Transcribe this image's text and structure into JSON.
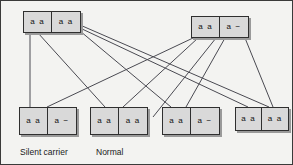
{
  "figure": {
    "background_color": "#f3f3f1",
    "box_fill_color": "#d9d9d9",
    "box_border_color": "#2f2f2f",
    "line_color": "#4a4a52"
  },
  "parents": [
    {
      "id": "parent-left",
      "left_allele": "a a",
      "right_allele": "a a",
      "x": 22,
      "y": 10,
      "w": 58,
      "h": 22
    },
    {
      "id": "parent-right",
      "left_allele": "a a",
      "right_allele": "a −",
      "x": 190,
      "y": 15,
      "w": 58,
      "h": 22
    }
  ],
  "offspring": [
    {
      "id": "offspring-1",
      "left_allele": "a a",
      "right_allele": "a −",
      "caption": "Silent carrier",
      "x": 18,
      "y": 106,
      "w": 58,
      "h": 28
    },
    {
      "id": "offspring-2",
      "left_allele": "a a",
      "right_allele": "a a",
      "caption": "Normal",
      "x": 89,
      "y": 106,
      "w": 58,
      "h": 28
    },
    {
      "id": "offspring-3",
      "left_allele": "a a",
      "right_allele": "a −",
      "caption": "",
      "x": 161,
      "y": 106,
      "w": 58,
      "h": 28
    },
    {
      "id": "offspring-4",
      "left_allele": "a a",
      "right_allele": "a a",
      "caption": "",
      "x": 234,
      "y": 106,
      "w": 54,
      "h": 24
    }
  ],
  "captions": [
    {
      "text": "Silent carrier",
      "x": 19,
      "y": 146
    },
    {
      "text": "Normal",
      "x": 95,
      "y": 146
    }
  ],
  "connections": [
    {
      "from": "parent-left",
      "x1": 29,
      "y1": 32,
      "x2": 29,
      "y2": 106
    },
    {
      "from": "parent-left",
      "x1": 37,
      "y1": 32,
      "x2": 104,
      "y2": 106
    },
    {
      "from": "parent-left",
      "x1": 79,
      "y1": 30,
      "x2": 170,
      "y2": 106
    },
    {
      "from": "parent-left",
      "x1": 79,
      "y1": 27,
      "x2": 247,
      "y2": 106
    },
    {
      "from": "parent-left",
      "x1": 79,
      "y1": 24,
      "x2": 268,
      "y2": 106
    },
    {
      "from": "parent-right",
      "x1": 192,
      "y1": 37,
      "x2": 46,
      "y2": 106
    },
    {
      "from": "parent-right",
      "x1": 197,
      "y1": 37,
      "x2": 122,
      "y2": 106
    },
    {
      "from": "parent-right",
      "x1": 215,
      "y1": 37,
      "x2": 152,
      "y2": 116
    },
    {
      "from": "parent-right",
      "x1": 224,
      "y1": 37,
      "x2": 185,
      "y2": 106
    },
    {
      "from": "parent-right",
      "x1": 244,
      "y1": 37,
      "x2": 272,
      "y2": 106
    }
  ]
}
